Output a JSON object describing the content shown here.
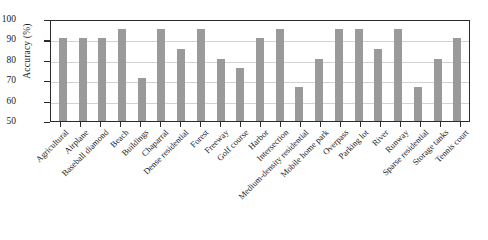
{
  "chart_data": {
    "type": "bar",
    "title": "",
    "xlabel": "",
    "ylabel": "Accuracy (%)",
    "ylim": [
      50,
      100
    ],
    "yticks": [
      50,
      60,
      70,
      80,
      90,
      100
    ],
    "grid": true,
    "legend": "none",
    "bar_color": "#9a9a9a",
    "axis_color": "#2b2b2b",
    "grid_color": "#d2d2d2",
    "categories": [
      "Agricultural",
      "Airplane",
      "Baseball diamond",
      "Beach",
      "Buildings",
      "Chaparral",
      "Dense residential",
      "Forest",
      "Freeway",
      "Golf course",
      "Harbor",
      "Intersection",
      "Medium-density residential",
      "Mobile home park",
      "Overpass",
      "Parking lot",
      "River",
      "Runway",
      "Sparse residential",
      "Storage tanks",
      "Tennis court"
    ],
    "values": [
      90.5,
      90.5,
      90.5,
      95.0,
      71.0,
      95.0,
      85.5,
      95.0,
      80.5,
      76.0,
      90.5,
      95.0,
      66.5,
      80.5,
      95.0,
      95.0,
      85.5,
      95.0,
      66.5,
      80.5,
      90.5
    ]
  }
}
